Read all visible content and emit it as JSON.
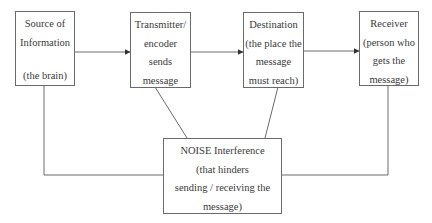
{
  "diagram": {
    "nodes": {
      "source": {
        "lines": [
          "Source of",
          "Information",
          "",
          "(the brain)"
        ]
      },
      "transmitter": {
        "lines": [
          "Transmitter/",
          "encoder",
          "sends",
          "message"
        ]
      },
      "destination": {
        "lines": [
          "Destination",
          "(the place the",
          "message",
          "must reach)"
        ]
      },
      "receiver": {
        "lines": [
          "Receiver",
          "(person who",
          "gets the",
          "message)"
        ]
      },
      "noise": {
        "lines": [
          "NOISE Interference",
          "(that hinders",
          "sending / receiving the",
          "message)"
        ]
      }
    },
    "edges": [
      {
        "from": "source",
        "to": "transmitter",
        "type": "arrow"
      },
      {
        "from": "transmitter",
        "to": "destination",
        "type": "arrow"
      },
      {
        "from": "destination",
        "to": "receiver",
        "type": "arrow"
      },
      {
        "from": "transmitter",
        "to": "noise",
        "type": "line"
      },
      {
        "from": "destination",
        "to": "noise",
        "type": "line"
      },
      {
        "from": "source",
        "to": "noise",
        "type": "line"
      },
      {
        "from": "receiver",
        "to": "noise",
        "type": "line"
      }
    ],
    "colors": {
      "line": "#6a6a6a",
      "text": "#3a3a3a",
      "background": "#ffffff"
    }
  }
}
